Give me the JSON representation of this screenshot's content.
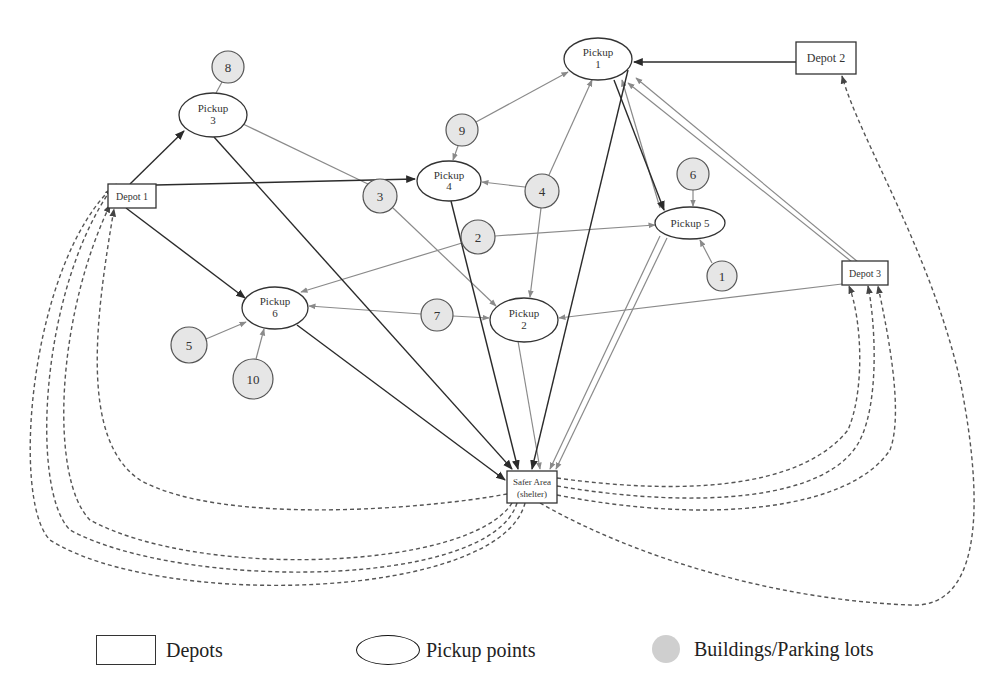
{
  "diagram": {
    "colors": {
      "stroke_dark": "#2b2b2b",
      "stroke_light": "#8a8a8a",
      "building_fill": "#e6e6e6",
      "legend_circle_fill": "#cfcfcf"
    },
    "depots": [
      {
        "id": "depot1",
        "label": "Depot 1",
        "x": 108,
        "y": 184,
        "w": 48,
        "h": 24
      },
      {
        "id": "depot2",
        "label": "Depot 2",
        "x": 796,
        "y": 42,
        "w": 60,
        "h": 32
      },
      {
        "id": "depot3",
        "label": "Depot 3",
        "x": 842,
        "y": 261,
        "w": 46,
        "h": 24
      }
    ],
    "shelter": {
      "id": "shelter",
      "label_line1": "Safer Area",
      "label_line2": "(shelter)",
      "x": 507,
      "y": 471,
      "w": 50,
      "h": 32
    },
    "pickups": [
      {
        "id": "pickup1",
        "line1": "Pickup",
        "line2": "1",
        "cx": 598,
        "cy": 59,
        "rx": 34,
        "ry": 21
      },
      {
        "id": "pickup2",
        "line1": "Pickup",
        "line2": "2",
        "cx": 524,
        "cy": 320,
        "rx": 34,
        "ry": 22
      },
      {
        "id": "pickup3",
        "line1": "Pickup",
        "line2": "3",
        "cx": 213,
        "cy": 115,
        "rx": 34,
        "ry": 22
      },
      {
        "id": "pickup4",
        "line1": "Pickup",
        "line2": "4",
        "cx": 449,
        "cy": 181,
        "rx": 32,
        "ry": 20
      },
      {
        "id": "pickup5",
        "line1": "Pickup 5",
        "line2": "",
        "cx": 690,
        "cy": 223,
        "rx": 35,
        "ry": 16
      },
      {
        "id": "pickup6",
        "line1": "Pickup",
        "line2": "6",
        "cx": 275,
        "cy": 308,
        "rx": 33,
        "ry": 21
      }
    ],
    "buildings": [
      {
        "id": "b1",
        "label": "1",
        "cx": 722,
        "cy": 276,
        "r": 15
      },
      {
        "id": "b2",
        "label": "2",
        "cx": 478,
        "cy": 237,
        "r": 17
      },
      {
        "id": "b3",
        "label": "3",
        "cx": 380,
        "cy": 196,
        "r": 17
      },
      {
        "id": "b4",
        "label": "4",
        "cx": 542,
        "cy": 191,
        "r": 17
      },
      {
        "id": "b5",
        "label": "5",
        "cx": 189,
        "cy": 345,
        "r": 18
      },
      {
        "id": "b6",
        "label": "6",
        "cx": 693,
        "cy": 174,
        "r": 16
      },
      {
        "id": "b7",
        "label": "7",
        "cx": 437,
        "cy": 315,
        "r": 16
      },
      {
        "id": "b8",
        "label": "8",
        "cx": 228,
        "cy": 67,
        "r": 16
      },
      {
        "id": "b9",
        "label": "9",
        "cx": 462,
        "cy": 130,
        "r": 16
      },
      {
        "id": "b10",
        "label": "10",
        "cx": 253,
        "cy": 379,
        "r": 20
      }
    ],
    "edges_solid_dark": [
      {
        "from": "Depot 1",
        "to": "Pickup 3"
      },
      {
        "from": "Depot 1",
        "to": "Pickup 4"
      },
      {
        "from": "Depot 1",
        "to": "Pickup 6"
      },
      {
        "from": "Depot 2",
        "to": "Pickup 1"
      },
      {
        "from": "Pickup 3",
        "to": "Safer Area"
      },
      {
        "from": "Pickup 4",
        "to": "Safer Area"
      },
      {
        "from": "Pickup 6",
        "to": "Safer Area"
      },
      {
        "from": "Pickup 1",
        "to": "Safer Area"
      },
      {
        "from": "Pickup 1",
        "to": "Pickup 5"
      }
    ],
    "edges_solid_light": [
      {
        "from": "Building 8",
        "to": "Pickup 3"
      },
      {
        "from": "Pickup 3",
        "to": "Pickup 2",
        "via": "Building 3"
      },
      {
        "from": "Building 9",
        "to": "Pickup 1"
      },
      {
        "from": "Building 9",
        "to": "Pickup 4"
      },
      {
        "from": "Building 4",
        "to": "Pickup 1"
      },
      {
        "from": "Building 4",
        "to": "Pickup 4"
      },
      {
        "from": "Building 4",
        "to": "Pickup 2"
      },
      {
        "from": "Building 2",
        "to": "Pickup 5"
      },
      {
        "from": "Building 2",
        "to": "Pickup 6"
      },
      {
        "from": "Building 7",
        "to": "Pickup 6"
      },
      {
        "from": "Building 7",
        "to": "Pickup 2"
      },
      {
        "from": "Building 5",
        "to": "Pickup 6"
      },
      {
        "from": "Building 10",
        "to": "Pickup 6"
      },
      {
        "from": "Building 6",
        "to": "Pickup 5"
      },
      {
        "from": "Building 1",
        "to": "Pickup 5"
      },
      {
        "from": "Depot 3",
        "to": "Pickup 2"
      },
      {
        "from": "Depot 3",
        "to": "Pickup 1",
        "count": 2
      },
      {
        "from": "Pickup 5",
        "to": "Pickup 1"
      },
      {
        "from": "Pickup 2",
        "to": "Safer Area"
      },
      {
        "from": "Pickup 5",
        "to": "Safer Area",
        "count": 2
      }
    ],
    "edges_dashed_return": [
      {
        "from": "Safer Area",
        "to": "Depot 1",
        "count": 4
      },
      {
        "from": "Safer Area",
        "to": "Depot 2",
        "count": 1
      },
      {
        "from": "Safer Area",
        "to": "Depot 3",
        "count": 3
      }
    ]
  },
  "legend": {
    "depots_label": "Depots",
    "pickup_label": "Pickup points",
    "buildings_label": "Buildings/Parking lots"
  }
}
